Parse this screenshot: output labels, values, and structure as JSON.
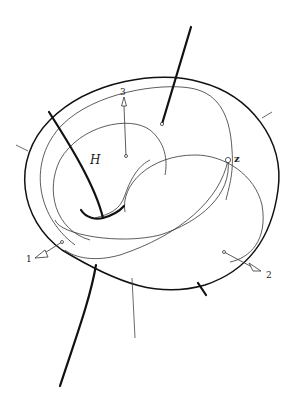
{
  "figure": {
    "labels": {
      "H": "H",
      "z": "z",
      "vector_1": "1",
      "vector_2": "2",
      "vector_3": "3"
    },
    "elements": {
      "outer_surface": "outer-boundary",
      "inner_loop": "inner-loop-curve",
      "curve_H": "heavy-curve-H",
      "point_z": "junction-point-z",
      "vectors": [
        "1",
        "2",
        "3"
      ]
    }
  }
}
